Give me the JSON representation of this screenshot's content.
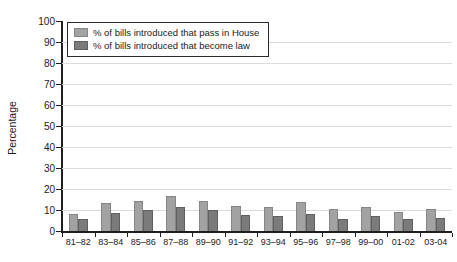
{
  "chart_data": {
    "type": "bar",
    "title": "",
    "xlabel": "",
    "ylabel": "Percentage",
    "ylim": [
      0,
      100
    ],
    "ytick_step": 10,
    "ytick_labels": [
      "0",
      "10",
      "20",
      "30",
      "40",
      "50",
      "60",
      "70",
      "80",
      "90",
      "100"
    ],
    "grid": "horizontal",
    "legend_position": "top-left",
    "categories": [
      "81–82",
      "83–84",
      "85–86",
      "87–88",
      "89–90",
      "91–92",
      "93–94",
      "95–96",
      "97–98",
      "99–00",
      "01-02",
      "03-04"
    ],
    "series": [
      {
        "name": "% of bills introduced that pass in House",
        "color": "#a2a2a2",
        "border_color": "#868686",
        "values": [
          8,
          13.5,
          14.5,
          16.5,
          14.5,
          12,
          11.5,
          14,
          10.5,
          11.5,
          9,
          10.5
        ]
      },
      {
        "name": "% of bills introduced that become law",
        "color": "#7b7b7b",
        "border_color": "#606060",
        "values": [
          5.5,
          8.5,
          10,
          11.5,
          10,
          7.5,
          7,
          8,
          5.5,
          7,
          5.5,
          6
        ]
      }
    ]
  },
  "colors": {
    "axis": "#1f1f1f",
    "gridline": "#dadada",
    "text": "#1a1a1a",
    "legend_border": "#2a2a2a",
    "legend_background": "#ffffff",
    "background": "#ffffff"
  }
}
